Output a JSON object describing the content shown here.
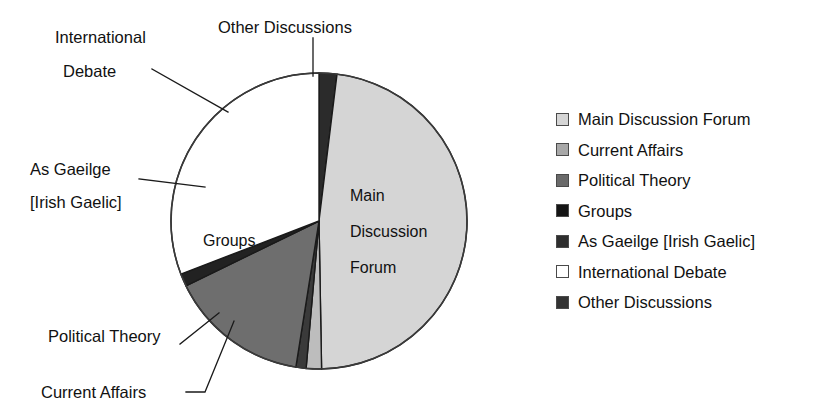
{
  "cut_title": "a stop has the same proportion as a same proportion,",
  "chart_data": {
    "type": "pie",
    "title": "",
    "subtitle": "",
    "xlabel": "",
    "ylabel": "",
    "grid": false,
    "legend_position": "right",
    "start_angle_deg": 0,
    "direction": "clockwise",
    "categories": [
      "Other Discussions",
      "Main Discussion Forum",
      "Current Affairs",
      "Political Theory",
      "Groups",
      "As Gaeilge [Irish Gaelic]",
      "International Debate"
    ],
    "values": [
      7,
      172,
      6,
      4,
      55,
      5,
      111
    ],
    "unit": "degrees",
    "percentages": [
      1.9,
      47.8,
      1.7,
      1.1,
      15.3,
      1.4,
      30.8
    ],
    "colors": [
      "#2b2b2b",
      "#d5d5d5",
      "#bdbdbd",
      "#3a3a3a",
      "#6e6e6e",
      "#222222",
      "#ffffff"
    ],
    "stroke": "#1a1a1a",
    "slices": [
      {
        "name": "Other Discussions",
        "sweep": 7,
        "color": "#2b2b2b"
      },
      {
        "name": "Main Discussion Forum",
        "sweep": 172,
        "color": "#d5d5d5"
      },
      {
        "name": "Current Affairs",
        "sweep": 6,
        "color": "#bdbdbd"
      },
      {
        "name": "Political Theory",
        "sweep": 4,
        "color": "#3a3a3a"
      },
      {
        "name": "Groups",
        "sweep": 55,
        "color": "#6e6e6e"
      },
      {
        "name": "As Gaeilge [Irish Gaelic]",
        "sweep": 5,
        "color": "#222222"
      },
      {
        "name": "International Debate",
        "sweep": 111,
        "color": "#ffffff"
      }
    ],
    "geometry": {
      "cx": 319,
      "cy": 221,
      "r": 148
    }
  },
  "callouts": {
    "international": "International",
    "debate": "Debate",
    "other_discussions": "Other Discussions",
    "as_gaeilge": "As Gaeilge",
    "irish_gaelic": "[Irish Gaelic]",
    "political_theory": "Political Theory",
    "current_affairs": "Current Affairs"
  },
  "slice_labels": {
    "main_line1": "Main",
    "main_line2": "Discussion",
    "main_line3": "Forum",
    "groups": "Groups"
  },
  "legend": {
    "items": [
      {
        "label": "Main Discussion Forum",
        "color": "#d5d5d5"
      },
      {
        "label": "Current Affairs",
        "color": "#a8a8a8"
      },
      {
        "label": "Political Theory",
        "color": "#6a6a6a"
      },
      {
        "label": "Groups",
        "color": "#151515"
      },
      {
        "label": "As Gaeilge [Irish Gaelic]",
        "color": "#2e2e2e"
      },
      {
        "label": "International Debate",
        "color": "#ffffff"
      },
      {
        "label": "Other Discussions",
        "color": "#333333"
      }
    ]
  }
}
